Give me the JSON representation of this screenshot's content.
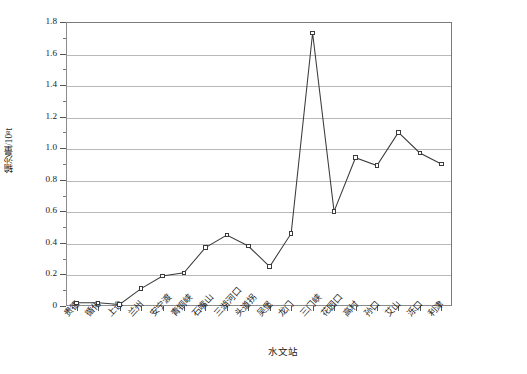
{
  "chart_data": {
    "type": "line",
    "title": "",
    "xlabel": "水文站",
    "ylabel": "输沙量/10⁸t",
    "categories": [
      "贵德",
      "循化",
      "上诠",
      "兰州",
      "安宁渡",
      "青铜峡",
      "石嘴山",
      "三湖河口",
      "头道拐",
      "吴堡",
      "龙门",
      "三门峡",
      "花园口",
      "高村",
      "孙口",
      "艾山",
      "泺口",
      "利津"
    ],
    "values": [
      0.02,
      0.02,
      0.01,
      0.11,
      0.19,
      0.21,
      0.37,
      0.45,
      0.38,
      0.25,
      0.46,
      1.73,
      0.6,
      0.94,
      0.89,
      1.1,
      0.97,
      0.9
    ],
    "series": [
      {
        "name": "输沙量",
        "values": [
          0.02,
          0.02,
          0.01,
          0.11,
          0.19,
          0.21,
          0.37,
          0.45,
          0.38,
          0.25,
          0.46,
          1.73,
          0.6,
          0.94,
          0.89,
          1.1,
          0.97,
          0.9
        ],
        "line_color": "#3b3b3b",
        "marker": "open-square",
        "marker_fill": "#ffffff",
        "marker_edge": "#3b3b3b"
      }
    ],
    "ylim": [
      0,
      1.8
    ],
    "ytick_step": 0.2,
    "ytick_minor_step": 0.1,
    "ytick_labels": [
      "0",
      "0.2",
      "0.4",
      "0.6",
      "0.8",
      "1.0",
      "1.2",
      "1.4",
      "1.6",
      "1.8"
    ],
    "ytick_values": [
      0,
      0.2,
      0.4,
      0.6,
      0.8,
      1.0,
      1.2,
      1.4,
      1.6,
      1.8
    ],
    "grid": true,
    "grid_axis": "y",
    "grid_color": "#b9b9b9",
    "legend": false,
    "legend_position": "none",
    "axis_color": "#8c8c8c",
    "background": "#ffffff",
    "annotations": []
  }
}
